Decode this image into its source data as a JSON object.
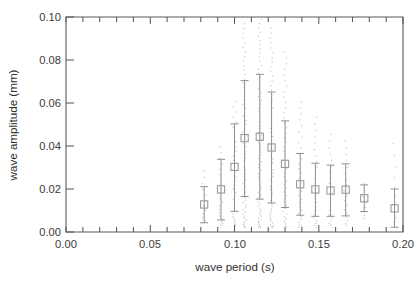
{
  "figure": {
    "background_color": "#ffffff",
    "axis_color": "#555a5e",
    "marker_color": "#949699",
    "errorbar_color": "#8d8f92",
    "scatter_color": "#b9bbbe"
  },
  "axes": {
    "x_title": "wave period (s)",
    "y_title": "wave amplitude (mm)",
    "x_ticklabels": [
      "0.00",
      "0.05",
      "0.10",
      "0.15",
      "0.20"
    ],
    "y_ticklabels": [
      "0.00",
      "0.02",
      "0.04",
      "0.06",
      "0.08",
      "0.10"
    ]
  },
  "chart_data": {
    "type": "scatter",
    "title": "",
    "xlabel": "wave period (s)",
    "ylabel": "wave amplitude (mm)",
    "xlim": [
      0.0,
      0.2
    ],
    "ylim": [
      0.0,
      0.1
    ],
    "x_major_ticks": [
      0.0,
      0.05,
      0.1,
      0.15,
      0.2
    ],
    "x_minor_tick_step": 0.01,
    "y_major_ticks": [
      0.0,
      0.02,
      0.04,
      0.06,
      0.08,
      0.1
    ],
    "grid": false,
    "legend": null,
    "marker_style": "open square with symmetric error bars",
    "series": [
      {
        "name": "binned mean wave amplitude",
        "x": [
          0.082,
          0.092,
          0.1,
          0.106,
          0.115,
          0.122,
          0.13,
          0.139,
          0.148,
          0.157,
          0.166,
          0.177,
          0.195
        ],
        "values": [
          0.0128,
          0.0198,
          0.0303,
          0.0437,
          0.0443,
          0.0393,
          0.0317,
          0.0222,
          0.0198,
          0.0193,
          0.0197,
          0.0157,
          0.011
        ],
        "error_low": [
          0.0085,
          0.0142,
          0.0207,
          0.0272,
          0.029,
          0.0258,
          0.0203,
          0.0144,
          0.0125,
          0.012,
          0.0122,
          0.0062,
          0.0088
        ],
        "error_high": [
          0.0083,
          0.014,
          0.02,
          0.0267,
          0.029,
          0.0258,
          0.02,
          0.0143,
          0.0122,
          0.0118,
          0.012,
          0.0062,
          0.009
        ]
      },
      {
        "name": "individual wave observations",
        "description": "dense vertical clouds of small grey dots at each binned wave period",
        "x": [
          0.082,
          0.092,
          0.1,
          0.106,
          0.115,
          0.122,
          0.13,
          0.139,
          0.148,
          0.157,
          0.166,
          0.177,
          0.195
        ],
        "y_min": [
          0.004,
          0.003,
          0.003,
          0.002,
          0.002,
          0.002,
          0.002,
          0.002,
          0.002,
          0.003,
          0.003,
          0.006,
          0.004
        ],
        "y_max": [
          0.03,
          0.041,
          0.062,
          0.098,
          0.1,
          0.096,
          0.085,
          0.062,
          0.055,
          0.047,
          0.044,
          0.024,
          0.044
        ],
        "counts": [
          12,
          20,
          34,
          62,
          70,
          58,
          44,
          30,
          24,
          20,
          18,
          8,
          10
        ]
      }
    ]
  }
}
